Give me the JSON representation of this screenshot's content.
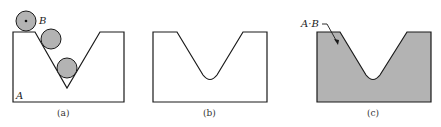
{
  "figure": {
    "panels": [
      {
        "id": "a",
        "caption": "(a)",
        "labels": {
          "ball": "B",
          "block": "A"
        }
      },
      {
        "id": "b",
        "caption": "(b)"
      },
      {
        "id": "c",
        "caption": "(c)",
        "labels": {
          "result": "A·B"
        }
      }
    ],
    "colors": {
      "stroke": "#1a1a1a",
      "fill": "#b3b3b3",
      "background": "#ffffff"
    }
  }
}
